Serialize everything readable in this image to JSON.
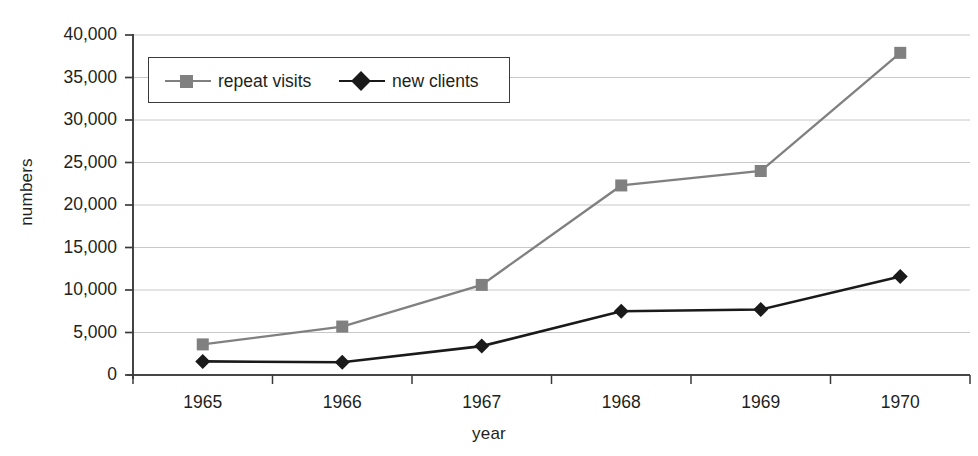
{
  "chart_data": {
    "type": "line",
    "title": "",
    "xlabel": "year",
    "ylabel": "numbers",
    "categories": [
      "1965",
      "1966",
      "1967",
      "1968",
      "1969",
      "1970"
    ],
    "series": [
      {
        "name": "repeat visits",
        "color": "#808080",
        "marker": "square",
        "values": [
          3600,
          5700,
          10600,
          22300,
          24000,
          37900
        ]
      },
      {
        "name": "new clients",
        "color": "#1a1a1a",
        "marker": "diamond",
        "values": [
          1600,
          1500,
          3400,
          7500,
          7700,
          11600
        ]
      }
    ],
    "ylim": [
      0,
      40000
    ],
    "ytick_values": [
      0,
      5000,
      10000,
      15000,
      20000,
      25000,
      30000,
      35000,
      40000
    ],
    "ytick_labels": [
      "0",
      "5,000",
      "10,000",
      "15,000",
      "20,000",
      "25,000",
      "30,000",
      "35,000",
      "40,000"
    ],
    "grid": "horizontal",
    "legend_position": "upper-left-inside"
  },
  "colors": {
    "axis": "#3a3a3a",
    "grid": "#c8c8c8",
    "text": "#231f20",
    "series_repeat_visits": "#808080",
    "series_new_clients": "#1a1a1a",
    "background": "#ffffff"
  }
}
